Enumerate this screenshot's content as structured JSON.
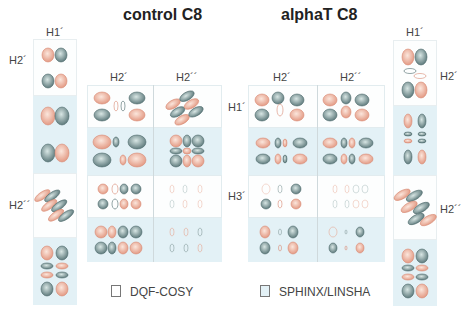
{
  "titles": {
    "left": "control C8",
    "right": "alphaT C8"
  },
  "left_strip": {
    "top_label": "H1´",
    "row_labels": [
      "H2´",
      "H2´´"
    ]
  },
  "left_grid": {
    "col_labels": [
      "H2´",
      "H2´´"
    ]
  },
  "right_grid": {
    "col_labels": [
      "H2´",
      "H2´´"
    ],
    "row_labels": [
      "H1´",
      "H3´"
    ]
  },
  "right_strip": {
    "top_label": "H1´",
    "row_labels": [
      "H2´",
      "H2´´"
    ]
  },
  "legend": {
    "items": [
      {
        "label": "DQF-COSY",
        "color": "#ffffff"
      },
      {
        "label": "SPHINX/LINSHA",
        "color": "#e3f1f6"
      }
    ]
  },
  "colors": {
    "positive": "#e8a08a",
    "negative": "#6f8a8a",
    "sim_bg": "#e3f1f6"
  }
}
